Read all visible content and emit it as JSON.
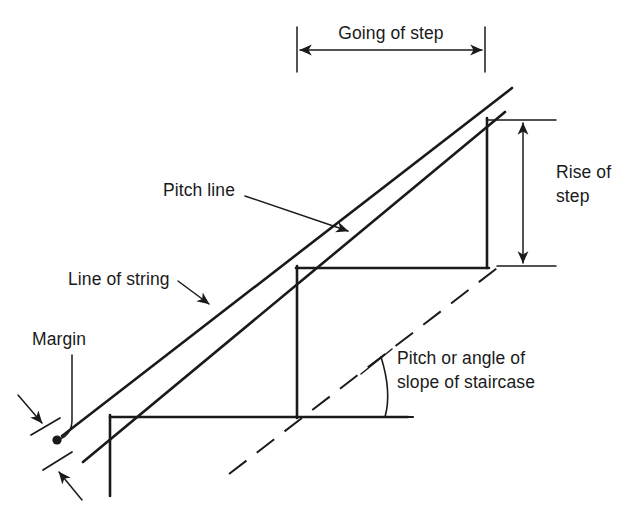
{
  "diagram": {
    "line_color": "#1a1a1a",
    "background_color": "#ffffff",
    "labels": {
      "going_of_step": "Going of step",
      "rise_of_step_line1": "Rise of",
      "rise_of_step_line2": "step",
      "pitch_line": "Pitch line",
      "line_of_string": "Line of string",
      "margin": "Margin",
      "pitch_angle_line1": "Pitch or angle of",
      "pitch_angle_line2": "slope of staircase"
    },
    "annotations": [
      {
        "name": "going-of-step",
        "type": "dimension",
        "text": "Going of step",
        "orientation": "horizontal"
      },
      {
        "name": "rise-of-step",
        "type": "dimension",
        "text": "Rise of step",
        "orientation": "vertical"
      },
      {
        "name": "pitch-line",
        "type": "leader-label",
        "text": "Pitch line"
      },
      {
        "name": "line-of-string",
        "type": "leader-label",
        "text": "Line of string"
      },
      {
        "name": "margin",
        "type": "leader-label",
        "text": "Margin"
      },
      {
        "name": "pitch-angle",
        "type": "angle-label",
        "text": "Pitch or angle of slope of staircase"
      }
    ]
  }
}
